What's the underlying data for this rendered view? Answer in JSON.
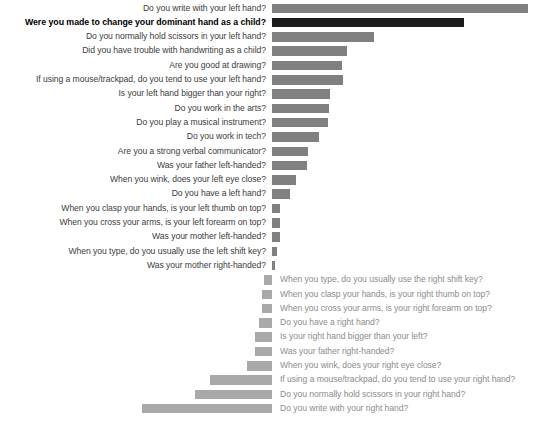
{
  "chart_data": {
    "type": "bar",
    "title": "",
    "subtitle": "",
    "xlabel": "",
    "ylabel": "",
    "grid": false,
    "legend": "none",
    "orientation": "horizontal",
    "direction_note": "Upper group bars extend rightward from a shared baseline with labels to the left; lower group bars extend leftward to the same baseline with labels to the right.",
    "baseline_x_px": 272,
    "series": [
      {
        "name": "left-hand questions",
        "color": "#808080",
        "highlight_color": "#1a1a1a",
        "direction": "right",
        "categories": [
          "Do you write with your left hand?",
          "Were you made to change your dominant hand as a child?",
          "Do you normally hold scissors in your left hand?",
          "Did you have trouble with handwriting as a child?",
          "Are you good at drawing?",
          "If using a mouse/trackpad, do you tend to use your left hand?",
          "Is your left hand bigger than your right?",
          "Do you work in the arts?",
          "Do you play a musical instrument?",
          "Do you work in tech?",
          "Are you a strong verbal communicator?",
          "Was your father left-handed?",
          "When you wink, does your left eye close?",
          "Do you have a left hand?",
          "When you clasp your hands, is your left thumb on top?",
          "When you cross your arms, is your left forearm on top?",
          "Was your mother left-handed?",
          "When you type, do you usually use the left shift key?",
          "Was your mother right-handed?"
        ],
        "values": [
          256,
          192,
          102,
          75,
          70,
          71,
          58,
          57,
          56,
          47,
          36,
          35,
          24,
          18,
          8,
          8,
          8,
          5,
          3
        ],
        "highlighted": [
          "Were you made to change your dominant hand as a child?"
        ]
      },
      {
        "name": "right-hand questions",
        "color": "#a9a9a9",
        "direction": "left",
        "categories": [
          "When you type, do you usually use the right shift key?",
          "When you clasp your hands, is your right thumb on top?",
          "When you cross your arms, is your right forearm on top?",
          "Do you have a right hand?",
          "Is your right hand bigger than your left?",
          "Was your father right-handed?",
          "When you wink, does your right eye close?",
          "If using a mouse/trackpad, do you tend to use your right hand?",
          "Do you normally hold scissors in your right hand?",
          "Do you write with your right hand?"
        ],
        "values": [
          8,
          10,
          10,
          13,
          17,
          17,
          25,
          62,
          77,
          130
        ]
      }
    ]
  },
  "rows": [
    {
      "group": "left",
      "label": "Do you write with your left hand?",
      "value": 256,
      "highlight": false
    },
    {
      "group": "left",
      "label": "Were you made to change your dominant hand as a child?",
      "value": 192,
      "highlight": true
    },
    {
      "group": "left",
      "label": "Do you normally hold scissors in your left hand?",
      "value": 102,
      "highlight": false
    },
    {
      "group": "left",
      "label": "Did you have trouble with handwriting as a child?",
      "value": 75,
      "highlight": false
    },
    {
      "group": "left",
      "label": "Are you good at drawing?",
      "value": 70,
      "highlight": false
    },
    {
      "group": "left",
      "label": "If using a mouse/trackpad, do you tend to use your left hand?",
      "value": 71,
      "highlight": false
    },
    {
      "group": "left",
      "label": "Is your left hand bigger than your right?",
      "value": 58,
      "highlight": false
    },
    {
      "group": "left",
      "label": "Do you work in the arts?",
      "value": 57,
      "highlight": false
    },
    {
      "group": "left",
      "label": "Do you play a musical instrument?",
      "value": 56,
      "highlight": false
    },
    {
      "group": "left",
      "label": "Do you work in tech?",
      "value": 47,
      "highlight": false
    },
    {
      "group": "left",
      "label": "Are you a strong verbal communicator?",
      "value": 36,
      "highlight": false
    },
    {
      "group": "left",
      "label": "Was your father left-handed?",
      "value": 35,
      "highlight": false
    },
    {
      "group": "left",
      "label": "When you wink, does your left eye close?",
      "value": 24,
      "highlight": false
    },
    {
      "group": "left",
      "label": "Do you have a left hand?",
      "value": 18,
      "highlight": false
    },
    {
      "group": "left",
      "label": "When you clasp your hands, is your left thumb on top?",
      "value": 8,
      "highlight": false
    },
    {
      "group": "left",
      "label": "When you cross your arms, is your left forearm on top?",
      "value": 8,
      "highlight": false
    },
    {
      "group": "left",
      "label": "Was your mother left-handed?",
      "value": 8,
      "highlight": false
    },
    {
      "group": "left",
      "label": "When you type, do you usually use the left shift key?",
      "value": 5,
      "highlight": false
    },
    {
      "group": "left",
      "label": "Was your mother right-handed?",
      "value": 3,
      "highlight": false
    },
    {
      "group": "right",
      "label": "When you type, do you usually use the right shift key?",
      "value": 8,
      "highlight": false
    },
    {
      "group": "right",
      "label": "When you clasp your hands, is your right thumb on top?",
      "value": 10,
      "highlight": false
    },
    {
      "group": "right",
      "label": "When you cross your arms, is your right forearm on top?",
      "value": 10,
      "highlight": false
    },
    {
      "group": "right",
      "label": "Do you have a right hand?",
      "value": 13,
      "highlight": false
    },
    {
      "group": "right",
      "label": "Is your right hand bigger than your left?",
      "value": 17,
      "highlight": false
    },
    {
      "group": "right",
      "label": "Was your father right-handed?",
      "value": 17,
      "highlight": false
    },
    {
      "group": "right",
      "label": "When you wink, does your right eye close?",
      "value": 25,
      "highlight": false
    },
    {
      "group": "right",
      "label": "If using a mouse/trackpad, do you tend to use your right hand?",
      "value": 62,
      "highlight": false
    },
    {
      "group": "right",
      "label": "Do you normally hold scissors in your right hand?",
      "value": 77,
      "highlight": false
    },
    {
      "group": "right",
      "label": "Do you write with your right hand?",
      "value": 130,
      "highlight": false
    }
  ]
}
